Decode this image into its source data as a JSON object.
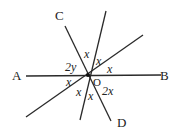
{
  "diagram": {
    "type": "intersecting-lines",
    "center_label": "O",
    "points": {
      "A": "A",
      "B": "B",
      "C": "C",
      "D": "D"
    },
    "lines": [
      {
        "name": "AB",
        "endpoints": [
          "A",
          "B"
        ]
      },
      {
        "name": "CD",
        "endpoints": [
          "C",
          "D"
        ]
      },
      {
        "name": "steep-unlabeled",
        "endpoints": []
      },
      {
        "name": "shallow-unlabeled",
        "endpoints": []
      }
    ],
    "angle_labels": {
      "top": "x",
      "upper_right": "x",
      "right": "x",
      "upper_left": "2y",
      "left": "x",
      "lower_left": "x",
      "bottom": "x",
      "lower_right": "2x"
    }
  }
}
